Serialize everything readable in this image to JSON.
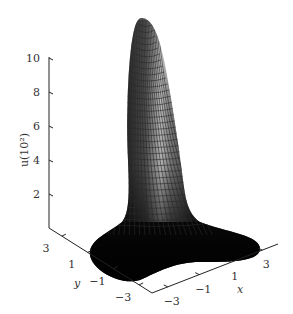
{
  "chart_data": {
    "type": "surface3d",
    "title": "",
    "xlabel": "x",
    "ylabel": "y",
    "zlabel": "u(10²)",
    "xlim": [
      -4,
      4
    ],
    "ylim": [
      -4,
      4
    ],
    "zlim": [
      0,
      10
    ],
    "x_ticks": [
      "-3",
      "-1",
      "1",
      "3"
    ],
    "y_ticks": [
      "3",
      "1",
      "-1",
      "-3"
    ],
    "z_ticks": [
      "2",
      "4",
      "6",
      "8",
      "10"
    ],
    "colormap": "grayscale (dark base, light peak highlight)",
    "peak": {
      "x": 0,
      "y": 0,
      "z": 10
    },
    "grid": false,
    "legend": null
  },
  "colors": {
    "axis": "#222222",
    "surface_dark": "#141414",
    "surface_light": "#d8d8d8",
    "mesh": "#2a2a2a",
    "background": "#ffffff"
  }
}
